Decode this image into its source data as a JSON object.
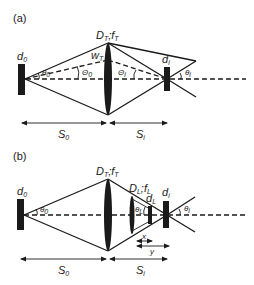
{
  "panels": [
    {
      "id": "a",
      "label": "(a)",
      "object_label": "d",
      "object_sub": "0",
      "lens_label": "D",
      "lens_sub": "T",
      "lens_sep": ";f",
      "lens_sub2": "T",
      "waist_label": "w",
      "waist_sub": "T",
      "theta0_small": "θ",
      "theta0_small_sub": "0",
      "Theta0": "Θ",
      "Theta0_sub": "0",
      "Thetai": "Θ",
      "Thetai_sub": "i",
      "image_label": "d",
      "image_sub": "i",
      "thetai": "θ",
      "thetai_sub": "i",
      "dist1": "S",
      "dist1_sub": "0",
      "dist2": "S",
      "dist2_sub": "i"
    },
    {
      "id": "b",
      "label": "(b)",
      "object_label": "d",
      "object_sub": "0",
      "lens_label": "D",
      "lens_sub": "T",
      "lens_sep": ";f",
      "lens_sub2": "T",
      "lens2_label": "D",
      "lens2_sub": "L",
      "lens2_sep": ";f",
      "lens2_sub2": "L",
      "theta0": "θ",
      "theta0_sub": "0",
      "thetaL": "θ",
      "thetaL_sub": "L",
      "detL_label": "d",
      "detL_sub": "L",
      "image_label": "d",
      "image_sub": "i",
      "thetai": "θ",
      "thetai_sub": "i",
      "x_label": "x",
      "y_label": "y",
      "dist1": "S",
      "dist1_sub": "0",
      "dist2": "S",
      "dist2_sub": "i"
    }
  ]
}
